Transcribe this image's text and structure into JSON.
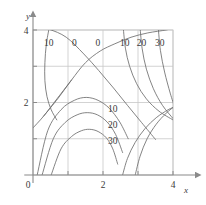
{
  "figure": {
    "background": "#ffffff",
    "grid_color": "#c8c8c8",
    "axis_color": "#8a8a8a",
    "contour_color": "#6e6e6e",
    "text_color": "#3a3a3a"
  },
  "axes": {
    "x_axis_label": "x",
    "y_axis_label": "y",
    "x_ticks": [
      "0",
      "2",
      "4"
    ],
    "y_ticks": [
      "2",
      "4"
    ],
    "origin_label": "0"
  },
  "contour_labels": {
    "top_row": [
      "10",
      "0",
      "0",
      "10",
      "20",
      "30"
    ],
    "middle_right": [
      "10",
      "20",
      "30"
    ]
  },
  "chart_data": {
    "type": "line",
    "title": "",
    "xlabel": "x",
    "ylabel": "y",
    "xlim": [
      0,
      4
    ],
    "ylim": [
      0,
      4
    ],
    "xticks": [
      0,
      2,
      4
    ],
    "yticks": [
      0,
      2,
      4
    ],
    "grid": true,
    "grid_spacing": 1,
    "legend": "none",
    "plot_kind": "contour",
    "levels": [
      0,
      10,
      20,
      30
    ],
    "annotations": [
      {
        "text": "10",
        "x": 0.45,
        "y": 3.55
      },
      {
        "text": "0",
        "x": 1.18,
        "y": 3.55
      },
      {
        "text": "0",
        "x": 1.85,
        "y": 3.55
      },
      {
        "text": "10",
        "x": 2.62,
        "y": 3.55
      },
      {
        "text": "20",
        "x": 3.1,
        "y": 3.55
      },
      {
        "text": "30",
        "x": 3.62,
        "y": 3.55
      },
      {
        "text": "10",
        "x": 2.28,
        "y": 1.73
      },
      {
        "text": "20",
        "x": 2.28,
        "y": 1.3
      },
      {
        "text": "30",
        "x": 2.28,
        "y": 0.86
      }
    ],
    "series": [
      {
        "name": "zero-line-left",
        "level": 0,
        "x": [
          0.3,
          0.72,
          1.1,
          1.5,
          1.92,
          2.34,
          2.8,
          3.28,
          3.8,
          4.0
        ],
        "y": [
          1.62,
          2.12,
          2.62,
          3.1,
          3.42,
          3.62,
          3.8,
          3.92,
          4.0,
          4.05
        ]
      },
      {
        "name": "zero-line-right",
        "level": 0,
        "x": [
          0.0,
          0.45,
          0.95,
          1.45,
          1.88,
          2.3,
          2.7,
          3.1,
          3.5
        ],
        "y": [
          4.08,
          4.02,
          3.8,
          3.34,
          2.88,
          2.4,
          1.92,
          1.45,
          0.98
        ]
      },
      {
        "name": "dome-10",
        "level": 10,
        "x": [
          0.12,
          0.42,
          0.8,
          1.18,
          1.52,
          1.86,
          2.18,
          2.48,
          2.72
        ],
        "y": [
          0.0,
          1.22,
          1.8,
          2.06,
          2.14,
          2.06,
          1.84,
          1.46,
          1.0
        ]
      },
      {
        "name": "dome-20",
        "level": 20,
        "x": [
          0.26,
          0.58,
          0.92,
          1.26,
          1.55,
          1.84,
          2.12,
          2.36,
          2.56
        ],
        "y": [
          0.0,
          1.0,
          1.45,
          1.66,
          1.72,
          1.66,
          1.46,
          1.12,
          0.62
        ]
      },
      {
        "name": "dome-30",
        "level": 30,
        "x": [
          0.52,
          0.8,
          1.1,
          1.38,
          1.62,
          1.86,
          2.1,
          2.28,
          2.42
        ],
        "y": [
          0.0,
          0.72,
          1.06,
          1.22,
          1.26,
          1.2,
          1.02,
          0.72,
          0.3
        ]
      },
      {
        "name": "left-10",
        "level": 10,
        "x": [
          0.46,
          0.38,
          0.34,
          0.34,
          0.4,
          0.52,
          0.68
        ],
        "y": [
          4.05,
          3.6,
          3.1,
          2.6,
          2.16,
          1.8,
          1.52
        ]
      },
      {
        "name": "right-10",
        "level": 10,
        "x": [
          2.58,
          2.64,
          2.76,
          2.96,
          3.24,
          3.6,
          4.0
        ],
        "y": [
          4.05,
          3.5,
          3.0,
          2.52,
          2.1,
          1.76,
          1.52
        ]
      },
      {
        "name": "right-20",
        "level": 20,
        "x": [
          3.06,
          3.12,
          3.24,
          3.44,
          3.7,
          4.0
        ],
        "y": [
          4.05,
          3.48,
          2.92,
          2.38,
          1.92,
          1.56
        ]
      },
      {
        "name": "right-30",
        "level": 30,
        "x": [
          3.58,
          3.64,
          3.76,
          3.92,
          4.05
        ],
        "y": [
          4.05,
          3.44,
          2.84,
          2.26,
          1.86
        ]
      },
      {
        "name": "right-20-lower",
        "level": 20,
        "x": [
          2.92,
          3.06,
          3.26,
          3.52,
          3.8,
          4.05
        ],
        "y": [
          0.0,
          0.52,
          1.0,
          1.4,
          1.7,
          1.9
        ]
      },
      {
        "name": "right-30-lower",
        "level": 30,
        "x": [
          2.56,
          2.7,
          2.92,
          3.2,
          3.52,
          3.86,
          4.05
        ],
        "y": [
          0.0,
          0.46,
          0.9,
          1.28,
          1.58,
          1.8,
          1.88
        ]
      },
      {
        "name": "left-diag-lower",
        "level": 0,
        "x": [
          0.0,
          0.3,
          0.7,
          1.1
        ],
        "y": [
          1.3,
          1.62,
          2.12,
          2.62
        ]
      }
    ]
  }
}
